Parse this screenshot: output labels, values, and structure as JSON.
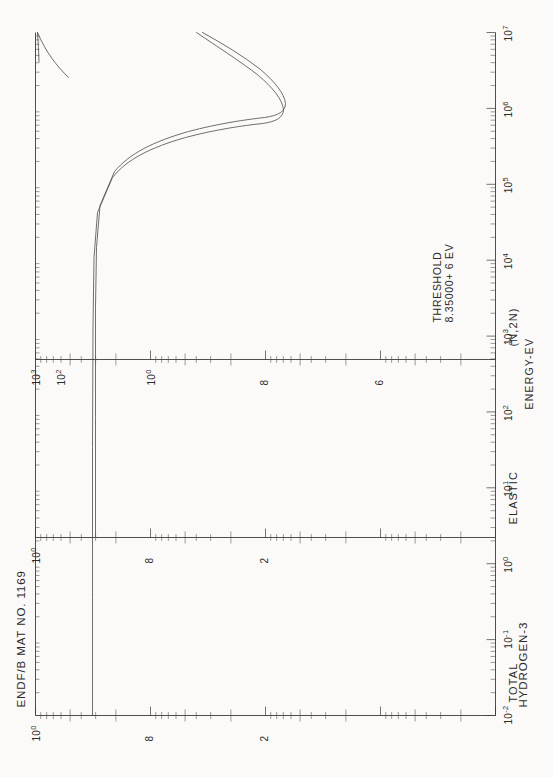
{
  "header": {
    "material": "HYDROGEN-3",
    "library": "ENDF/B MAT NO. 1169"
  },
  "xaxis": {
    "label": "ENERGY-EV",
    "ticks": [
      "10-2",
      "10-1",
      "100",
      "101",
      "102",
      "103",
      "104",
      "105",
      "106",
      "107"
    ],
    "tick_html": [
      "10<sup>-2</sup>",
      "10<sup>-1</sup>",
      "10<sup>0</sup>",
      "10<sup>1</sup>",
      "10<sup>2</sup>",
      "10<sup>3</sup>",
      "10<sup>4</sup>",
      "10<sup>5</sup>",
      "10<sup>6</sup>",
      "10<sup>7</sup>"
    ],
    "min_exp": -2,
    "max_exp": 7
  },
  "panels": [
    {
      "name": "TOTAL",
      "ylabels": [
        "2",
        "8",
        "100"
      ],
      "ylabels_html": [
        "2",
        "8",
        "10<sup>0</sup>"
      ]
    },
    {
      "name": "ELASTIC",
      "ylabels": [
        "2",
        "8",
        "100"
      ],
      "ylabels_html": [
        "2",
        "8",
        "10<sup>0</sup>"
      ]
    },
    {
      "name": "(N,2N)",
      "ylabels": [
        "6",
        "8",
        "100",
        "102",
        "103"
      ],
      "ylabels_html": [
        "6",
        "8",
        "10<sup>0</sup>",
        "10<sup>2</sup>",
        "10<sup>3</sup>"
      ],
      "annotation_line1": "THRESHOLD",
      "annotation_line2": "8.35000+ 6 EV"
    }
  ],
  "colors": {
    "ink": "#3a3a3a",
    "curve": "#555555",
    "paper": "#fbfaf8"
  },
  "chart_data": {
    "type": "line",
    "title": "HYDROGEN-3 ENDF/B MAT NO. 1169",
    "xlabel": "ENERGY-EV",
    "ylabel": "CROSS SECTION (BARNS)",
    "xscale": "log",
    "yscale": "log",
    "xlim": [
      0.01,
      10000000
    ],
    "grid": false,
    "legend": "none",
    "series": [
      {
        "name": "TOTAL",
        "x": [
          0.01,
          0.1,
          1,
          10,
          100,
          1000,
          10000,
          100000,
          300000,
          1000000,
          2000000,
          3500000,
          5000000,
          8350000,
          10000000,
          14000000,
          20000000
        ],
        "y": [
          7.0,
          7.0,
          7.0,
          7.0,
          7.0,
          7.0,
          7.0,
          6.95,
          6.6,
          4.2,
          2.35,
          1.95,
          2.05,
          2.3,
          2.45,
          2.6,
          2.7
        ]
      },
      {
        "name": "ELASTIC",
        "x": [
          0.01,
          0.1,
          1,
          10,
          100,
          1000,
          10000,
          100000,
          300000,
          1000000,
          2000000,
          3500000,
          5000000,
          8350000,
          10000000,
          14000000,
          20000000
        ],
        "y": [
          6.9,
          6.9,
          6.9,
          6.9,
          6.9,
          6.9,
          6.9,
          6.85,
          6.5,
          4.0,
          2.2,
          1.8,
          1.85,
          2.0,
          2.1,
          2.25,
          2.35
        ]
      },
      {
        "name": "(N,2N)",
        "x": [
          8350000,
          9000000,
          10000000,
          12000000,
          14000000,
          17000000,
          20000000
        ],
        "y": [
          0.001,
          0.02,
          0.06,
          0.13,
          0.2,
          0.28,
          0.34
        ],
        "threshold_ev": 8350000,
        "threshold_text": "THRESHOLD 8.35000+ 6 EV"
      }
    ]
  }
}
